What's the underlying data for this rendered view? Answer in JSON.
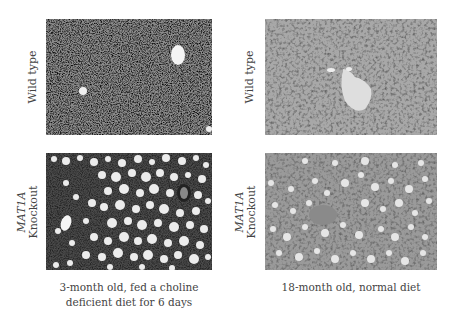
{
  "figure": {
    "columns": [
      {
        "caption_line1": "3-month old, fed a choline",
        "caption_line2": "deficient diet for 6 days"
      },
      {
        "caption_line1": "18-month old, normal diet",
        "caption_line2": ""
      }
    ],
    "rows": [
      {
        "label": "Wild type"
      },
      {
        "label_gene": "MAT1A",
        "label_line2": "Knockout"
      }
    ],
    "panels": [
      {
        "id": "wt-3mo",
        "description": "Wild type liver histology, dense dark tissue with small vessels"
      },
      {
        "id": "wt-18mo",
        "description": "Wild type liver histology, uniform hepatocytes with central vein"
      },
      {
        "id": "ko-3mo",
        "description": "MAT1A knockout liver, extensive macrovesicular steatosis"
      },
      {
        "id": "ko-18mo",
        "description": "MAT1A knockout liver, moderate steatosis"
      }
    ],
    "colors": {
      "text": "#444444",
      "background": "#ffffff"
    }
  }
}
